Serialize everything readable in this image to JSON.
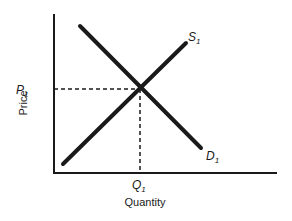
{
  "diagram": {
    "type": "supply-demand",
    "axes": {
      "y_label": "Price",
      "x_label": "Quantity"
    },
    "curves": {
      "supply": {
        "label": "S",
        "subscript": "1"
      },
      "demand": {
        "label": "D",
        "subscript": "1"
      }
    },
    "equilibrium": {
      "price_label": "P",
      "price_subscript": "1",
      "quantity_label": "Q",
      "quantity_subscript": "1"
    },
    "colors": {
      "ink": "#1a1a1a",
      "background": "#ffffff"
    }
  }
}
